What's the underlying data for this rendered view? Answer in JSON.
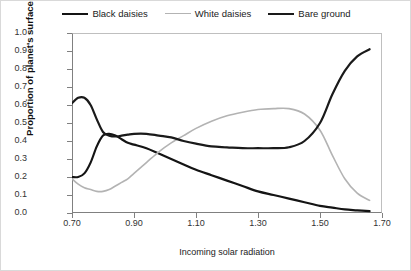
{
  "chart_data": {
    "type": "line",
    "title": "",
    "xlabel": "Incoming solar radiation",
    "ylabel": "Proportion of planet's surface",
    "xlim": [
      0.7,
      1.7
    ],
    "ylim": [
      0.0,
      1.0
    ],
    "xticks": [
      "0.70",
      "0.90",
      "1.10",
      "1.30",
      "1.50",
      "1.70"
    ],
    "xtick_values": [
      0.7,
      0.9,
      1.1,
      1.3,
      1.5,
      1.7
    ],
    "yticks": [
      "0.0",
      "0.1",
      "0.2",
      "0.3",
      "0.4",
      "0.5",
      "0.6",
      "0.7",
      "0.8",
      "0.9",
      "1.0"
    ],
    "ytick_values": [
      0.0,
      0.1,
      0.2,
      0.3,
      0.4,
      0.5,
      0.6,
      0.7,
      0.8,
      0.9,
      1.0
    ],
    "grid": false,
    "legend_position": "top-center",
    "x": [
      0.7,
      0.72,
      0.74,
      0.76,
      0.78,
      0.8,
      0.82,
      0.84,
      0.86,
      0.88,
      0.9,
      0.94,
      0.98,
      1.02,
      1.06,
      1.1,
      1.15,
      1.2,
      1.25,
      1.3,
      1.35,
      1.4,
      1.45,
      1.5,
      1.54,
      1.58,
      1.62,
      1.66
    ],
    "series": [
      {
        "name": "Black daisies",
        "color": "#141414",
        "width": 2.2,
        "values": [
          0.2,
          0.2,
          0.22,
          0.28,
          0.37,
          0.43,
          0.44,
          0.43,
          0.41,
          0.39,
          0.38,
          0.36,
          0.33,
          0.3,
          0.27,
          0.24,
          0.21,
          0.18,
          0.15,
          0.12,
          0.1,
          0.08,
          0.06,
          0.04,
          0.03,
          0.02,
          0.015,
          0.01
        ]
      },
      {
        "name": "White daisies",
        "color": "#b3b3b3",
        "width": 1.6,
        "values": [
          0.19,
          0.16,
          0.14,
          0.13,
          0.12,
          0.12,
          0.13,
          0.15,
          0.17,
          0.19,
          0.22,
          0.28,
          0.34,
          0.39,
          0.43,
          0.47,
          0.51,
          0.54,
          0.56,
          0.575,
          0.58,
          0.58,
          0.55,
          0.46,
          0.32,
          0.19,
          0.11,
          0.07
        ]
      },
      {
        "name": "Bare ground",
        "color": "#1a1a1a",
        "width": 2.2,
        "values": [
          0.61,
          0.64,
          0.64,
          0.6,
          0.52,
          0.45,
          0.43,
          0.425,
          0.43,
          0.435,
          0.44,
          0.44,
          0.43,
          0.42,
          0.4,
          0.385,
          0.37,
          0.365,
          0.36,
          0.36,
          0.36,
          0.365,
          0.4,
          0.5,
          0.66,
          0.79,
          0.87,
          0.91
        ]
      }
    ]
  },
  "legend": {
    "items": [
      {
        "label": "Black daisies",
        "color": "#141414",
        "width": 2.6
      },
      {
        "label": "White daisies",
        "color": "#b3b3b3",
        "width": 1.4
      },
      {
        "label": "Bare ground",
        "color": "#1a1a1a",
        "width": 2.6
      }
    ]
  }
}
